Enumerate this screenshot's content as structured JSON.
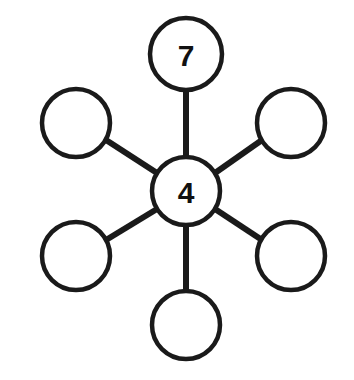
{
  "diagram": {
    "type": "hub-and-spoke-wheel",
    "background_color": "#ffffff",
    "stroke_color": "#1a1a1a",
    "text_color": "#111111",
    "center_node": {
      "id": "center",
      "label": "4",
      "cx": 186,
      "cy": 191,
      "r": 34,
      "filled": false
    },
    "outer_nodes": [
      {
        "id": "top",
        "label": "7",
        "cx": 186,
        "cy": 54,
        "r": 36,
        "angle_deg": 90,
        "empty": false
      },
      {
        "id": "upper-right",
        "label": "",
        "cx": 291,
        "cy": 123,
        "r": 34,
        "angle_deg": 30,
        "empty": true
      },
      {
        "id": "lower-right",
        "label": "",
        "cx": 291,
        "cy": 256,
        "r": 34,
        "angle_deg": -30,
        "empty": true
      },
      {
        "id": "bottom",
        "label": "",
        "cx": 186,
        "cy": 325,
        "r": 34,
        "angle_deg": -90,
        "empty": true
      },
      {
        "id": "lower-left",
        "label": "",
        "cx": 76,
        "cy": 256,
        "r": 34,
        "angle_deg": -150,
        "empty": true
      },
      {
        "id": "upper-left",
        "label": "",
        "cx": 76,
        "cy": 123,
        "r": 34,
        "angle_deg": 150,
        "empty": true
      }
    ],
    "spokes": [
      {
        "id": "spoke-top",
        "x1": 186,
        "y1": 157,
        "x2": 186,
        "y2": 90
      },
      {
        "id": "spoke-upper-right",
        "x1": 215,
        "y1": 173,
        "x2": 262,
        "y2": 140
      },
      {
        "id": "spoke-lower-right",
        "x1": 215,
        "y1": 209,
        "x2": 262,
        "y2": 240
      },
      {
        "id": "spoke-bottom",
        "x1": 186,
        "y1": 225,
        "x2": 186,
        "y2": 291
      },
      {
        "id": "spoke-lower-left",
        "x1": 157,
        "y1": 209,
        "x2": 106,
        "y2": 240
      },
      {
        "id": "spoke-upper-left",
        "x1": 157,
        "y1": 173,
        "x2": 106,
        "y2": 140
      }
    ]
  }
}
